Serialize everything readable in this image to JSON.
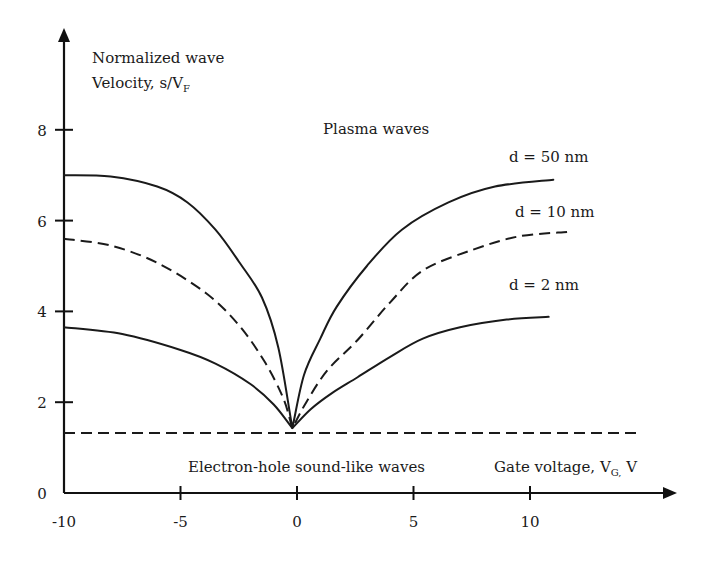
{
  "chart_data": {
    "type": "line",
    "title": "",
    "ylabel": {
      "line1": "Normalized wave",
      "line2_main": "Velocity, s/V",
      "line2_sub": "F"
    },
    "xlabel": {
      "main": "Gate voltage, V",
      "sub": "G,",
      "unit": " V"
    },
    "xlim": [
      -10,
      15
    ],
    "ylim": [
      0,
      9.8
    ],
    "x_ticks": [
      {
        "value": -10,
        "label": "-10"
      },
      {
        "value": -5,
        "label": "-5"
      },
      {
        "value": 0,
        "label": "0"
      },
      {
        "value": 5,
        "label": "5"
      },
      {
        "value": 10,
        "label": "10"
      }
    ],
    "y_ticks": [
      {
        "value": 0,
        "label": "0"
      },
      {
        "value": 2,
        "label": "2"
      },
      {
        "value": 4,
        "label": "4"
      },
      {
        "value": 6,
        "label": "6"
      },
      {
        "value": 8,
        "label": "8"
      }
    ],
    "grid": false,
    "legend": "none",
    "annotations": {
      "plasma": "Plasma waves",
      "sound": "Electron-hole sound-like waves",
      "d50": "d = 50 nm",
      "d10": "d = 10 nm",
      "d2": "d = 2 nm"
    },
    "series": [
      {
        "name": "d = 50 nm",
        "style": "solid",
        "x": [
          -10,
          -8,
          -6,
          -4.7,
          -3.5,
          -2.5,
          -1.5,
          -0.8,
          -0.2,
          0.3,
          1.0,
          1.7,
          3.0,
          4.5,
          6.5,
          8.5,
          11.0
        ],
        "y": [
          7.0,
          6.97,
          6.75,
          6.4,
          5.8,
          5.1,
          4.3,
          3.2,
          1.43,
          2.6,
          3.4,
          4.1,
          5.0,
          5.8,
          6.4,
          6.75,
          6.9
        ]
      },
      {
        "name": "d = 10 nm",
        "style": "dashed",
        "x": [
          -10,
          -8,
          -6,
          -3.9,
          -2.5,
          -1.4,
          -0.6,
          -0.2,
          0.4,
          1.3,
          2.6,
          4.0,
          5.4,
          7.5,
          9.5,
          11.6
        ],
        "y": [
          5.6,
          5.45,
          5.07,
          4.4,
          3.7,
          2.9,
          2.1,
          1.43,
          2.0,
          2.7,
          3.37,
          4.2,
          4.9,
          5.35,
          5.65,
          5.75
        ]
      },
      {
        "name": "d = 2 nm",
        "style": "solid",
        "x": [
          -10,
          -7.5,
          -5,
          -3.5,
          -2,
          -1,
          -0.2,
          0.6,
          1.5,
          2.6,
          4.0,
          5.4,
          7.0,
          9.0,
          10.8
        ],
        "y": [
          3.65,
          3.5,
          3.15,
          2.85,
          2.4,
          1.95,
          1.43,
          1.85,
          2.2,
          2.55,
          3.0,
          3.4,
          3.65,
          3.82,
          3.88
        ]
      },
      {
        "name": "Electron-hole sound",
        "style": "dashed",
        "x": [
          -10,
          14.7
        ],
        "y": [
          1.32,
          1.32
        ]
      }
    ]
  }
}
